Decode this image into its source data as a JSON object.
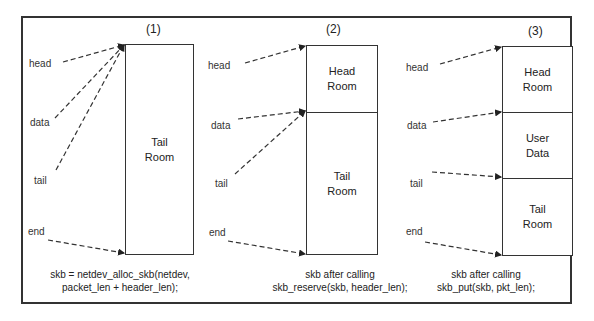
{
  "panels": [
    {
      "title": "(1)",
      "pointers": [
        "head",
        "data",
        "tail",
        "end"
      ],
      "segments": [
        {
          "line1": "Tail",
          "line2": "Room"
        }
      ],
      "caption": {
        "line1": "skb = netdev_alloc_skb(netdev,",
        "line2": "packet_len + header_len);"
      }
    },
    {
      "title": "(2)",
      "pointers": [
        "head",
        "data",
        "tail",
        "end"
      ],
      "segments": [
        {
          "line1": "Head",
          "line2": "Room"
        },
        {
          "line1": "Tail",
          "line2": "Room"
        }
      ],
      "caption": {
        "line1": "skb after calling",
        "line2": "skb_reserve(skb, header_len);"
      }
    },
    {
      "title": "(3)",
      "pointers": [
        "head",
        "data",
        "tail",
        "end"
      ],
      "segments": [
        {
          "line1": "Head",
          "line2": "Room"
        },
        {
          "line1": "User",
          "line2": "Data"
        },
        {
          "line1": "Tail",
          "line2": "Room"
        }
      ],
      "caption": {
        "line1": "skb after calling",
        "line2": "skb_put(skb, pkt_len);"
      }
    }
  ],
  "colors": {
    "line": "#333333",
    "background": "#ffffff"
  }
}
